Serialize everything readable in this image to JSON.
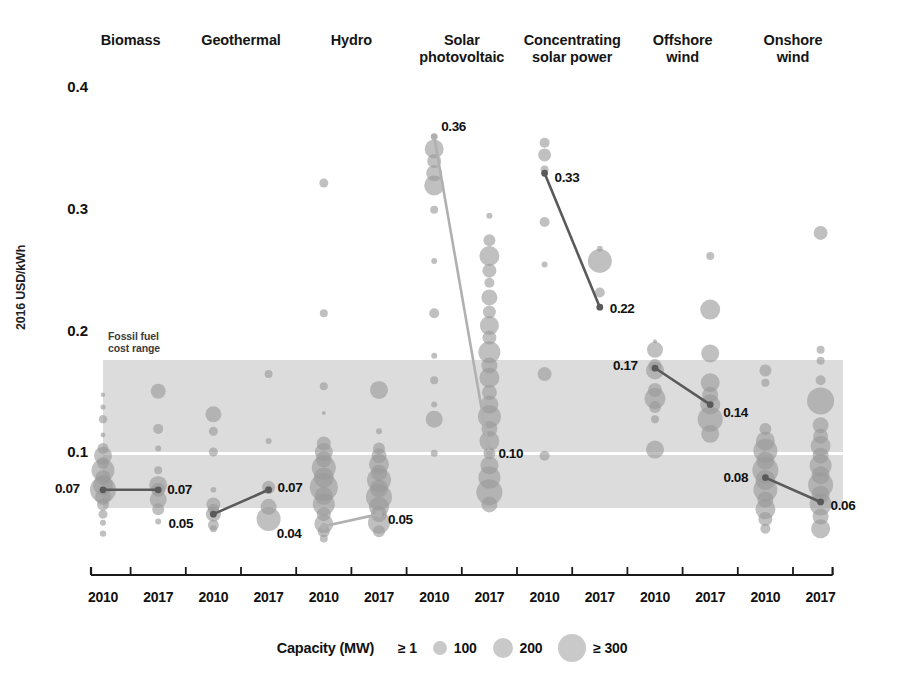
{
  "chart_data": {
    "type": "scatter",
    "title": "",
    "xlabel": "",
    "ylabel": "2016 USD/kWh",
    "ylim": [
      0.0,
      0.4
    ],
    "yticks": [
      0.1,
      0.2,
      0.3,
      0.4
    ],
    "ytick_labels": [
      "0.1",
      "0.2",
      "0.3",
      "0.4"
    ],
    "grid": false,
    "legend_position": "bottom",
    "size_legend": {
      "title": "Capacity (MW)",
      "entries": [
        {
          "label": "≥ 1",
          "px": 3
        },
        {
          "label": "100",
          "px": 7
        },
        {
          "label": "200",
          "px": 10
        },
        {
          "label": "≥ 300",
          "px": 14
        }
      ]
    },
    "bands": [
      {
        "name": "Fossil fuel cost range",
        "label": "Fossil fuel\ncost range",
        "y_top": 0.177,
        "y_bottom": 0.055,
        "midline": 0.1,
        "color": "#d4d4d4",
        "midline_color": "#ffffff"
      }
    ],
    "categories": [
      "Biomass",
      "Geothermal",
      "Hydro",
      "Solar photovoltaic",
      "Concentrating solar power",
      "Offshore wind",
      "Onshore wind"
    ],
    "x_groups": [
      "2010",
      "2017"
    ],
    "weighted_average_values": [
      {
        "technology": "Biomass",
        "2010": 0.07,
        "2017": 0.07
      },
      {
        "technology": "Geothermal",
        "2010": 0.05,
        "2017": 0.07
      },
      {
        "technology": "Hydro",
        "2010": 0.04,
        "2017": 0.05
      },
      {
        "technology": "Solar photovoltaic",
        "2010": 0.36,
        "2017": 0.1
      },
      {
        "technology": "Concentrating solar power",
        "2010": 0.33,
        "2017": 0.22
      },
      {
        "technology": "Offshore wind",
        "2010": 0.17,
        "2017": 0.14
      },
      {
        "technology": "Onshore wind",
        "2010": 0.08,
        "2017": 0.06
      }
    ],
    "annotations": [
      {
        "text": "0.36",
        "technology": "Solar photovoltaic",
        "year": "2010",
        "value": 0.36
      },
      {
        "text": "0.33",
        "technology": "Concentrating solar power",
        "year": "2010",
        "value": 0.33
      },
      {
        "text": "0.22",
        "technology": "Concentrating solar power",
        "year": "2017",
        "value": 0.22
      },
      {
        "text": "0.17",
        "technology": "Offshore wind",
        "year": "2010",
        "value": 0.17
      },
      {
        "text": "0.14",
        "technology": "Offshore wind",
        "year": "2017",
        "value": 0.14
      },
      {
        "text": "0.10",
        "technology": "Solar photovoltaic",
        "year": "2017",
        "value": 0.1
      },
      {
        "text": "0.08",
        "technology": "Onshore wind",
        "year": "2010",
        "value": 0.08
      },
      {
        "text": "0.07",
        "technology": "Biomass",
        "year": "2010",
        "value": 0.07
      },
      {
        "text": "0.07",
        "technology": "Biomass",
        "year": "2017",
        "value": 0.07
      },
      {
        "text": "0.07",
        "technology": "Geothermal",
        "year": "2017",
        "value": 0.07
      },
      {
        "text": "0.05",
        "technology": "Geothermal",
        "year": "2010",
        "value": 0.05
      },
      {
        "text": "0.05",
        "technology": "Hydro",
        "year": "2017",
        "value": 0.05
      },
      {
        "text": "0.04",
        "technology": "Hydro",
        "year": "2010",
        "value": 0.04
      },
      {
        "text": "0.06",
        "technology": "Onshore wind",
        "year": "2017",
        "value": 0.06
      }
    ],
    "xtick_labels": [
      "2010",
      "2017",
      "2010",
      "2017",
      "2010",
      "2017",
      "2010",
      "2017",
      "2010",
      "2017",
      "2010",
      "2017",
      "2010",
      "2017"
    ],
    "bubbles": {
      "Biomass": {
        "2010": [
          {
            "y": 0.148,
            "r": 2.2
          },
          {
            "y": 0.138,
            "r": 2.6
          },
          {
            "y": 0.128,
            "r": 4.2
          },
          {
            "y": 0.115,
            "r": 2.4
          },
          {
            "y": 0.104,
            "r": 5.5
          },
          {
            "y": 0.098,
            "r": 9.0
          },
          {
            "y": 0.092,
            "r": 6.0
          },
          {
            "y": 0.086,
            "r": 11.5
          },
          {
            "y": 0.08,
            "r": 7.5
          },
          {
            "y": 0.074,
            "r": 10.0
          },
          {
            "y": 0.07,
            "r": 13.0
          },
          {
            "y": 0.064,
            "r": 8.0
          },
          {
            "y": 0.058,
            "r": 6.0
          },
          {
            "y": 0.05,
            "r": 4.5
          },
          {
            "y": 0.043,
            "r": 3.0
          },
          {
            "y": 0.034,
            "r": 3.2
          }
        ],
        "2017": [
          {
            "y": 0.151,
            "r": 7.5
          },
          {
            "y": 0.12,
            "r": 5.0
          },
          {
            "y": 0.104,
            "r": 3.0
          },
          {
            "y": 0.086,
            "r": 4.0
          },
          {
            "y": 0.074,
            "r": 9.0
          },
          {
            "y": 0.07,
            "r": 7.0
          },
          {
            "y": 0.062,
            "r": 8.5
          },
          {
            "y": 0.054,
            "r": 6.0
          },
          {
            "y": 0.044,
            "r": 3.0
          }
        ]
      },
      "Geothermal": {
        "2010": [
          {
            "y": 0.132,
            "r": 8.0
          },
          {
            "y": 0.118,
            "r": 4.5
          },
          {
            "y": 0.101,
            "r": 4.5
          },
          {
            "y": 0.07,
            "r": 2.8
          },
          {
            "y": 0.058,
            "r": 7.0
          },
          {
            "y": 0.054,
            "r": 5.5
          },
          {
            "y": 0.05,
            "r": 7.5
          },
          {
            "y": 0.041,
            "r": 5.5
          },
          {
            "y": 0.038,
            "r": 3.5
          }
        ],
        "2017": [
          {
            "y": 0.165,
            "r": 4.0
          },
          {
            "y": 0.11,
            "r": 3.0
          },
          {
            "y": 0.072,
            "r": 6.5
          },
          {
            "y": 0.07,
            "r": 4.0
          },
          {
            "y": 0.056,
            "r": 8.0
          },
          {
            "y": 0.046,
            "r": 12.0
          }
        ]
      },
      "Hydro": {
        "2010": [
          {
            "y": 0.322,
            "r": 4.5
          },
          {
            "y": 0.215,
            "r": 4.0
          },
          {
            "y": 0.155,
            "r": 4.0
          },
          {
            "y": 0.133,
            "r": 2.0
          },
          {
            "y": 0.108,
            "r": 7.0
          },
          {
            "y": 0.101,
            "r": 9.0
          },
          {
            "y": 0.095,
            "r": 8.0
          },
          {
            "y": 0.088,
            "r": 12.0
          },
          {
            "y": 0.08,
            "r": 10.0
          },
          {
            "y": 0.072,
            "r": 14.0
          },
          {
            "y": 0.065,
            "r": 9.0
          },
          {
            "y": 0.058,
            "r": 11.0
          },
          {
            "y": 0.05,
            "r": 7.0
          },
          {
            "y": 0.042,
            "r": 9.5
          },
          {
            "y": 0.036,
            "r": 6.0
          },
          {
            "y": 0.03,
            "r": 4.0
          }
        ],
        "2017": [
          {
            "y": 0.152,
            "r": 9.0
          },
          {
            "y": 0.118,
            "r": 3.0
          },
          {
            "y": 0.104,
            "r": 6.0
          },
          {
            "y": 0.098,
            "r": 7.5
          },
          {
            "y": 0.091,
            "r": 10.0
          },
          {
            "y": 0.084,
            "r": 8.0
          },
          {
            "y": 0.078,
            "r": 12.0
          },
          {
            "y": 0.071,
            "r": 9.0
          },
          {
            "y": 0.064,
            "r": 13.0
          },
          {
            "y": 0.056,
            "r": 10.0
          },
          {
            "y": 0.05,
            "r": 8.0
          },
          {
            "y": 0.043,
            "r": 11.0
          },
          {
            "y": 0.036,
            "r": 6.0
          }
        ]
      },
      "Solar photovoltaic": {
        "2010": [
          {
            "y": 0.36,
            "r": 3.0
          },
          {
            "y": 0.35,
            "r": 9.5
          },
          {
            "y": 0.34,
            "r": 7.0
          },
          {
            "y": 0.33,
            "r": 8.0
          },
          {
            "y": 0.32,
            "r": 10.0
          },
          {
            "y": 0.3,
            "r": 4.0
          },
          {
            "y": 0.258,
            "r": 3.0
          },
          {
            "y": 0.215,
            "r": 5.0
          },
          {
            "y": 0.18,
            "r": 3.0
          },
          {
            "y": 0.16,
            "r": 4.0
          },
          {
            "y": 0.14,
            "r": 3.0
          },
          {
            "y": 0.128,
            "r": 8.5
          },
          {
            "y": 0.1,
            "r": 3.5
          }
        ],
        "2017": [
          {
            "y": 0.295,
            "r": 3.0
          },
          {
            "y": 0.275,
            "r": 6.0
          },
          {
            "y": 0.262,
            "r": 10.0
          },
          {
            "y": 0.25,
            "r": 7.0
          },
          {
            "y": 0.24,
            "r": 5.0
          },
          {
            "y": 0.228,
            "r": 8.0
          },
          {
            "y": 0.216,
            "r": 6.5
          },
          {
            "y": 0.205,
            "r": 9.5
          },
          {
            "y": 0.195,
            "r": 7.0
          },
          {
            "y": 0.183,
            "r": 11.0
          },
          {
            "y": 0.172,
            "r": 8.0
          },
          {
            "y": 0.162,
            "r": 10.0
          },
          {
            "y": 0.15,
            "r": 7.5
          },
          {
            "y": 0.14,
            "r": 9.0
          },
          {
            "y": 0.13,
            "r": 11.5
          },
          {
            "y": 0.12,
            "r": 8.0
          },
          {
            "y": 0.11,
            "r": 10.0
          },
          {
            "y": 0.1,
            "r": 6.0
          },
          {
            "y": 0.09,
            "r": 9.0
          },
          {
            "y": 0.08,
            "r": 11.0
          },
          {
            "y": 0.068,
            "r": 13.0
          },
          {
            "y": 0.058,
            "r": 8.0
          }
        ]
      },
      "Concentrating solar power": {
        "2010": [
          {
            "y": 0.355,
            "r": 5.0
          },
          {
            "y": 0.345,
            "r": 6.5
          },
          {
            "y": 0.333,
            "r": 4.0
          },
          {
            "y": 0.29,
            "r": 5.0
          },
          {
            "y": 0.255,
            "r": 3.0
          },
          {
            "y": 0.165,
            "r": 7.0
          },
          {
            "y": 0.098,
            "r": 5.0
          }
        ],
        "2017": [
          {
            "y": 0.268,
            "r": 3.0
          },
          {
            "y": 0.258,
            "r": 12.0
          },
          {
            "y": 0.232,
            "r": 5.0
          },
          {
            "y": 0.22,
            "r": 3.0
          }
        ]
      },
      "Offshore wind": {
        "2010": [
          {
            "y": 0.192,
            "r": 2.0
          },
          {
            "y": 0.185,
            "r": 8.0
          },
          {
            "y": 0.172,
            "r": 6.5
          },
          {
            "y": 0.168,
            "r": 9.0
          },
          {
            "y": 0.152,
            "r": 7.0
          },
          {
            "y": 0.145,
            "r": 10.5
          },
          {
            "y": 0.138,
            "r": 6.0
          },
          {
            "y": 0.128,
            "r": 4.0
          },
          {
            "y": 0.103,
            "r": 9.0
          }
        ],
        "2017": [
          {
            "y": 0.262,
            "r": 4.0
          },
          {
            "y": 0.218,
            "r": 10.0
          },
          {
            "y": 0.182,
            "r": 9.0
          },
          {
            "y": 0.158,
            "r": 9.5
          },
          {
            "y": 0.148,
            "r": 8.0
          },
          {
            "y": 0.14,
            "r": 10.0
          },
          {
            "y": 0.128,
            "r": 12.5
          },
          {
            "y": 0.116,
            "r": 9.0
          }
        ]
      },
      "Onshore wind": {
        "2010": [
          {
            "y": 0.168,
            "r": 6.0
          },
          {
            "y": 0.158,
            "r": 4.0
          },
          {
            "y": 0.12,
            "r": 6.0
          },
          {
            "y": 0.11,
            "r": 9.5
          },
          {
            "y": 0.102,
            "r": 12.0
          },
          {
            "y": 0.094,
            "r": 9.0
          },
          {
            "y": 0.086,
            "r": 13.0
          },
          {
            "y": 0.078,
            "r": 10.0
          },
          {
            "y": 0.07,
            "r": 12.0
          },
          {
            "y": 0.062,
            "r": 8.0
          },
          {
            "y": 0.054,
            "r": 10.0
          },
          {
            "y": 0.046,
            "r": 7.0
          },
          {
            "y": 0.038,
            "r": 5.0
          }
        ],
        "2017": [
          {
            "y": 0.281,
            "r": 7.0
          },
          {
            "y": 0.185,
            "r": 4.0
          },
          {
            "y": 0.176,
            "r": 4.0
          },
          {
            "y": 0.16,
            "r": 5.0
          },
          {
            "y": 0.143,
            "r": 13.5
          },
          {
            "y": 0.123,
            "r": 8.0
          },
          {
            "y": 0.114,
            "r": 7.5
          },
          {
            "y": 0.106,
            "r": 10.0
          },
          {
            "y": 0.098,
            "r": 8.0
          },
          {
            "y": 0.09,
            "r": 11.0
          },
          {
            "y": 0.082,
            "r": 9.0
          },
          {
            "y": 0.074,
            "r": 12.5
          },
          {
            "y": 0.066,
            "r": 9.0
          },
          {
            "y": 0.058,
            "r": 11.0
          },
          {
            "y": 0.048,
            "r": 8.0
          },
          {
            "y": 0.038,
            "r": 9.5
          }
        ]
      }
    },
    "colors": {
      "bubble": "#9a9a9a",
      "bubble_light": "#c6c6c6",
      "band": "#d4d4d4",
      "connector_dark": "#5a5a5a",
      "connector_light": "#b0b0b0",
      "axis": "#1a1a1a",
      "text": "#111111"
    }
  }
}
